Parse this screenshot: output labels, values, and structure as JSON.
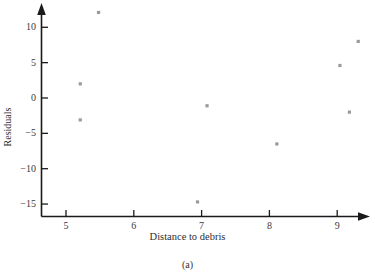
{
  "chart_data": {
    "type": "scatter",
    "title": "",
    "subtitle": "",
    "caption": "(a)",
    "xlabel": "Distance to debris",
    "ylabel": "Residuals",
    "xlim": [
      4.6,
      9.6
    ],
    "ylim": [
      -17.0,
      13.0
    ],
    "xticks": [
      5,
      6,
      7,
      8,
      9
    ],
    "xtick_labels": [
      "5",
      "6",
      "7",
      "8",
      "9"
    ],
    "yticks": [
      10,
      5,
      0,
      -5,
      -10,
      -15
    ],
    "ytick_labels": [
      "10",
      "5",
      "0",
      "−5",
      "−10",
      "−15"
    ],
    "grid": false,
    "legend": null,
    "marker": "square",
    "marker_color": "#9a9a9a",
    "axis_color": "#1a1a1a",
    "series": [
      {
        "name": "residuals",
        "points": [
          {
            "x": 5.21,
            "y": 2.0
          },
          {
            "x": 5.21,
            "y": -3.1
          },
          {
            "x": 5.48,
            "y": 12.1
          },
          {
            "x": 6.94,
            "y": -14.7
          },
          {
            "x": 7.08,
            "y": -1.1
          },
          {
            "x": 8.11,
            "y": -6.5
          },
          {
            "x": 9.04,
            "y": 4.6
          },
          {
            "x": 9.18,
            "y": -2.0
          },
          {
            "x": 9.31,
            "y": 8.0
          }
        ]
      }
    ]
  },
  "axes": {
    "x_title": "Distance to debris",
    "y_title": "Residuals"
  },
  "figure": {
    "caption": "(a)"
  }
}
